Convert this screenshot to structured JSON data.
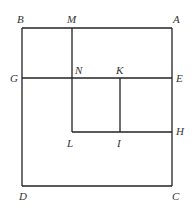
{
  "diagram": {
    "stroke": "#222222",
    "lines": [
      {
        "id": "BA",
        "x1": 22,
        "y1": 28,
        "x2": 172,
        "y2": 28
      },
      {
        "id": "BD",
        "x1": 22,
        "y1": 28,
        "x2": 22,
        "y2": 186
      },
      {
        "id": "DC",
        "x1": 22,
        "y1": 186,
        "x2": 172,
        "y2": 186
      },
      {
        "id": "AC",
        "x1": 172,
        "y1": 28,
        "x2": 172,
        "y2": 186
      },
      {
        "id": "ML",
        "x1": 72,
        "y1": 28,
        "x2": 72,
        "y2": 132
      },
      {
        "id": "GE",
        "x1": 22,
        "y1": 78,
        "x2": 172,
        "y2": 78
      },
      {
        "id": "LH",
        "x1": 72,
        "y1": 132,
        "x2": 172,
        "y2": 132
      },
      {
        "id": "KI",
        "x1": 120,
        "y1": 78,
        "x2": 120,
        "y2": 132
      }
    ],
    "labels": [
      {
        "text": "B",
        "x": 17,
        "y": 14
      },
      {
        "text": "M",
        "x": 67,
        "y": 14
      },
      {
        "text": "A",
        "x": 173,
        "y": 14
      },
      {
        "text": "G",
        "x": 10,
        "y": 73
      },
      {
        "text": "N",
        "x": 75,
        "y": 65
      },
      {
        "text": "K",
        "x": 116,
        "y": 65
      },
      {
        "text": "E",
        "x": 176,
        "y": 73
      },
      {
        "text": "L",
        "x": 67,
        "y": 138
      },
      {
        "text": "I",
        "x": 117,
        "y": 138
      },
      {
        "text": "H",
        "x": 176,
        "y": 126
      },
      {
        "text": "D",
        "x": 19,
        "y": 191
      },
      {
        "text": "C",
        "x": 172,
        "y": 191
      }
    ]
  }
}
